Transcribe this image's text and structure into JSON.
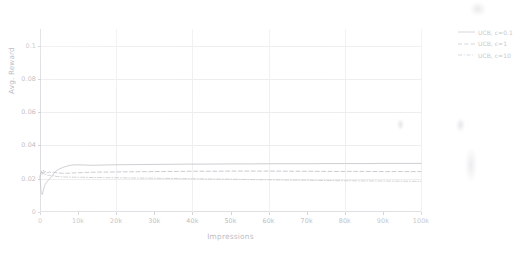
{
  "chart_data": {
    "type": "line",
    "title": "",
    "xlabel": "Impressions",
    "ylabel": "Avg. Reward",
    "xlim": [
      0,
      100000
    ],
    "ylim": [
      0,
      0.11
    ],
    "grid": true,
    "legend_position": "right-outside",
    "x_tick_labels": [
      "0",
      "10k",
      "20k",
      "30k",
      "40k",
      "50k",
      "60k",
      "70k",
      "80k",
      "90k",
      "100k"
    ],
    "x_tick_values": [
      0,
      10000,
      20000,
      30000,
      40000,
      50000,
      60000,
      70000,
      80000,
      90000,
      100000
    ],
    "y_tick_labels": [
      "0",
      "0.02",
      "0.04",
      "0.06",
      "0.08",
      "0.1"
    ],
    "y_tick_values": [
      0,
      0.02,
      0.04,
      0.06,
      0.08,
      0.1
    ],
    "x": [
      0,
      300,
      600,
      900,
      1200,
      1600,
      2000,
      2500,
      3000,
      3600,
      4200,
      5000,
      6000,
      7000,
      8000,
      9000,
      10000,
      12000,
      14000,
      16000,
      18000,
      20000,
      25000,
      30000,
      35000,
      40000,
      45000,
      50000,
      55000,
      60000,
      65000,
      70000,
      75000,
      80000,
      85000,
      90000,
      95000,
      100000
    ],
    "series": [
      {
        "name": "UCB, c=0.1",
        "style": "solid",
        "color": "#c2c2c8",
        "final_value": 0.0292,
        "values": [
          0.0205,
          0.0118,
          0.0104,
          0.0131,
          0.0158,
          0.0176,
          0.0186,
          0.0199,
          0.0213,
          0.0231,
          0.0246,
          0.0258,
          0.0268,
          0.0275,
          0.0281,
          0.0283,
          0.0284,
          0.0282,
          0.0281,
          0.0282,
          0.0283,
          0.0284,
          0.0285,
          0.0286,
          0.0287,
          0.0288,
          0.0288,
          0.0289,
          0.0289,
          0.029,
          0.029,
          0.029,
          0.0291,
          0.0291,
          0.0291,
          0.0292,
          0.0292,
          0.0292
        ]
      },
      {
        "name": "UCB, c=1",
        "style": "dashed",
        "color": "#bdbdc4",
        "final_value": 0.0243,
        "values": [
          0.0212,
          0.0248,
          0.0231,
          0.0252,
          0.0238,
          0.0246,
          0.0235,
          0.0241,
          0.0237,
          0.024,
          0.0236,
          0.0234,
          0.0233,
          0.0233,
          0.0234,
          0.0235,
          0.0236,
          0.0238,
          0.0239,
          0.024,
          0.024,
          0.0241,
          0.0242,
          0.0243,
          0.0244,
          0.0245,
          0.0245,
          0.0246,
          0.0246,
          0.0246,
          0.0245,
          0.0245,
          0.0244,
          0.0244,
          0.0244,
          0.0243,
          0.0243,
          0.0243
        ]
      },
      {
        "name": "UCB, c=10",
        "style": "dashdot",
        "color": "#c6c6cc",
        "final_value": 0.0184,
        "values": [
          0.0208,
          0.0241,
          0.0226,
          0.0238,
          0.0222,
          0.0228,
          0.0219,
          0.0222,
          0.0216,
          0.0218,
          0.0214,
          0.0212,
          0.0211,
          0.021,
          0.021,
          0.0209,
          0.0209,
          0.0208,
          0.0207,
          0.0207,
          0.0206,
          0.0206,
          0.0204,
          0.0203,
          0.0201,
          0.02,
          0.0198,
          0.0197,
          0.0195,
          0.0194,
          0.0192,
          0.0191,
          0.0189,
          0.0188,
          0.0187,
          0.0186,
          0.0185,
          0.0184
        ]
      }
    ]
  },
  "legend": {
    "items": [
      {
        "label": "UCB, c=0.1"
      },
      {
        "label": "UCB, c=1"
      },
      {
        "label": "UCB, c=10"
      }
    ]
  }
}
